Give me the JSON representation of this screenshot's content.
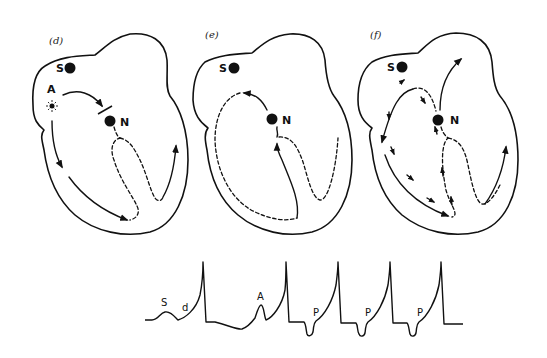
{
  "figure": {
    "panels": [
      {
        "id": "d",
        "label": "(d)",
        "nodes": {
          "sinus": "S",
          "ectopic": "A",
          "av": "N"
        },
        "description": "Atrial ectopic focus A fires; impulse blocked before AV node N while conducting down atrial wall"
      },
      {
        "id": "e",
        "label": "(e)",
        "nodes": {
          "sinus": "S",
          "av": "N"
        },
        "description": "Retrograde impulse from ventricle through N re-entering atrium (dashed loop)"
      },
      {
        "id": "f",
        "label": "(f)",
        "nodes": {
          "sinus": "S",
          "av": "N"
        },
        "description": "Impulse from N spreading in multiple directions through atrium and ventricle"
      }
    ],
    "ecg": {
      "labels": {
        "s_wave": "S",
        "d_wave": "d",
        "a_wave": "A",
        "p_waves": [
          "P",
          "P",
          "P"
        ]
      },
      "beats": [
        {
          "type": "sinus",
          "deflections": [
            "S",
            "d"
          ],
          "spike": "upright"
        },
        {
          "type": "atrial-premature",
          "deflections": [
            "A"
          ],
          "spike": "upright"
        },
        {
          "type": "retrograde",
          "deflections": [
            "P"
          ],
          "p_polarity": "inverted",
          "spike": "upright"
        },
        {
          "type": "retrograde",
          "deflections": [
            "P"
          ],
          "p_polarity": "inverted",
          "spike": "upright"
        },
        {
          "type": "retrograde",
          "deflections": [
            "P"
          ],
          "p_polarity": "inverted",
          "spike": "upright"
        }
      ]
    }
  },
  "colors": {
    "ink": "#111111",
    "background": "#ffffff"
  }
}
